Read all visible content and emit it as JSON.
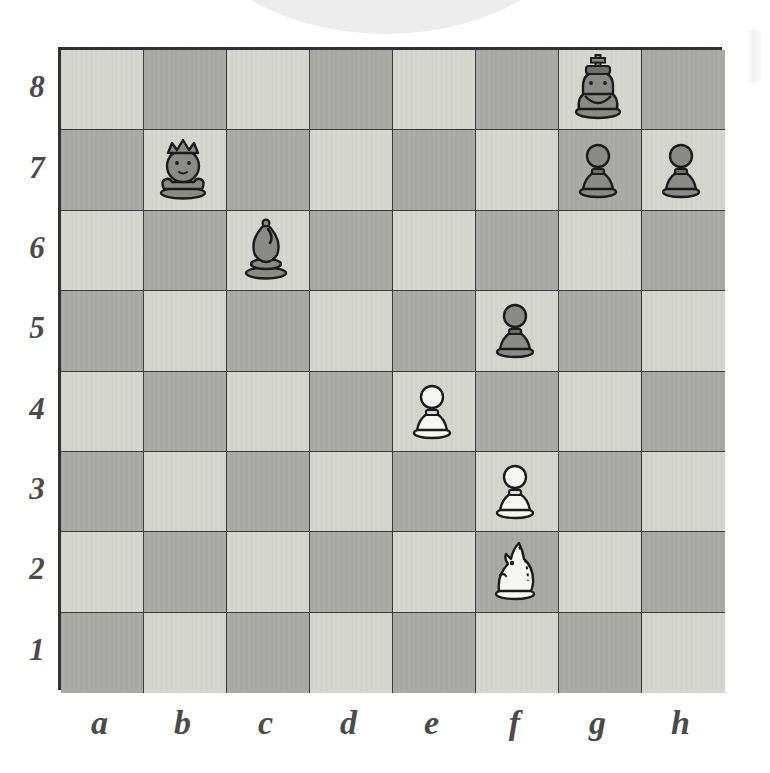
{
  "diagram": {
    "kind": "chess-board-diagram",
    "orientation": "white-bottom",
    "board": {
      "files": [
        "a",
        "b",
        "c",
        "d",
        "e",
        "f",
        "g",
        "h"
      ],
      "ranks": [
        "8",
        "7",
        "6",
        "5",
        "4",
        "3",
        "2",
        "1"
      ],
      "light_square_color": "#d6d6d1",
      "dark_square_color": "#a9a9a5",
      "border_color": "#2e2e2e"
    },
    "pieces": [
      {
        "square": "g8",
        "color": "black",
        "type": "king",
        "glyph": "♚",
        "label": "black-king-g8"
      },
      {
        "square": "b7",
        "color": "black",
        "type": "queen",
        "glyph": "♛",
        "label": "black-queen-b7"
      },
      {
        "square": "g7",
        "color": "black",
        "type": "pawn",
        "glyph": "♟",
        "label": "black-pawn-g7"
      },
      {
        "square": "h7",
        "color": "black",
        "type": "pawn",
        "glyph": "♟",
        "label": "black-pawn-h7"
      },
      {
        "square": "c6",
        "color": "black",
        "type": "bishop",
        "glyph": "♝",
        "label": "black-bishop-c6"
      },
      {
        "square": "f5",
        "color": "black",
        "type": "pawn",
        "glyph": "♟",
        "label": "black-pawn-f5"
      },
      {
        "square": "e4",
        "color": "white",
        "type": "pawn",
        "glyph": "♙",
        "label": "white-pawn-e4"
      },
      {
        "square": "f3",
        "color": "white",
        "type": "pawn",
        "glyph": "♙",
        "label": "white-pawn-f3"
      },
      {
        "square": "f2",
        "color": "white",
        "type": "knight",
        "glyph": "♘",
        "label": "white-knight-f2"
      },
      {
        "square": "f1",
        "color": "white",
        "type": "rook",
        "glyph": "♖",
        "label": "white-rook-f1"
      },
      {
        "square": "g1",
        "color": "white",
        "type": "king",
        "glyph": "♔",
        "label": "white-king-g1"
      }
    ],
    "arrows": [
      {
        "id": "arrow-b7-e4",
        "from": "b7",
        "to": "e4",
        "shape": "straight",
        "color": "#111111",
        "description": "black queen b7 attacks e4"
      },
      {
        "id": "arrow-c6-e4",
        "from": "c6",
        "to": "e4",
        "shape": "straight",
        "color": "#111111",
        "description": "black bishop c6 attacks e4"
      },
      {
        "id": "arrow-f5-e4",
        "from": "f5",
        "to": "e4",
        "shape": "straight",
        "color": "#111111",
        "description": "black pawn f5 attacks e4"
      },
      {
        "id": "arrow-f3-e4",
        "from": "f3",
        "to": "e4",
        "shape": "straight",
        "color": "#111111",
        "description": "white pawn f3 defends e4"
      },
      {
        "id": "arrow-f2-e4",
        "from": "f2",
        "to": "e4",
        "shape": "knight-L",
        "color": "#111111",
        "description": "white knight f2 defends e4"
      }
    ],
    "focus_square": "e4",
    "attack_count": 3,
    "defend_count": 2
  },
  "decoration": {
    "top_arc_color": "#ededed",
    "notch_color": "#ffffff",
    "notch_count": 7
  }
}
